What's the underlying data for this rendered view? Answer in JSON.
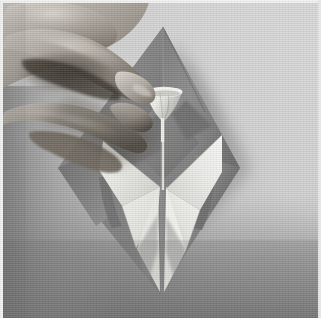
{
  "image": {
    "title": "Origami folding step photograph",
    "subject": "Two hands folding a square sheet of paper into an origami model",
    "medium": "grayscale photograph",
    "width": 321,
    "height": 318,
    "alt_text": "A pair of hands pinching the small white cone-shaped flap at the centre of a diamond-oriented sheet of grey origami paper; below it two white triangular points form a V shape.",
    "border": {
      "name": "thin white print border along the top and left edges",
      "color": "#f2f2f0",
      "thickness_px": 3
    },
    "palette": {
      "background_light": "#d2d2d2",
      "background_mid": "#c4c4c4",
      "background_shadow": "#a6a6a6",
      "table_dark": "#7d7d7d",
      "table_darkest": "#616161",
      "paper_light_face": "#ededea",
      "paper_white_highlight": "#f6f6f3",
      "paper_mid_face": "#9a9a9a",
      "paper_dark_face": "#6f6f6f",
      "paper_darkest_face": "#4e4e4e",
      "skin_light": "#c9c4bd",
      "skin_mid": "#9d968d",
      "skin_dark": "#6a6359",
      "skin_darkest": "#3a342d",
      "crease_line": "#5a5a5a"
    },
    "regions": [
      {
        "name": "background-surface",
        "description": "flat light grey table top filling the frame"
      },
      {
        "name": "cast-shadow",
        "description": "soft grey shadow cast down-right of the paper diamond"
      },
      {
        "name": "origami-paper-diamond",
        "description": "square sheet rotated 45 degrees, apex at top"
      },
      {
        "name": "left-hand-fingers",
        "description": "curled fingers of the left hand entering from upper left"
      },
      {
        "name": "pinching-fingertips",
        "description": "index finger and thumb tips meeting at the small white cone"
      },
      {
        "name": "white-cone-flap",
        "description": "small funnel shaped white flap standing up at the centre"
      },
      {
        "name": "center-crease",
        "description": "vertical crease line running from the cone to the bottom point"
      },
      {
        "name": "left-white-petal",
        "description": "white triangular point opening to the left"
      },
      {
        "name": "right-white-petal",
        "description": "white triangular point opening to the right"
      },
      {
        "name": "bottom-point",
        "description": "long narrow point of the model reaching the bottom of the frame"
      },
      {
        "name": "lower-dark-band",
        "description": "darker gradient band across the bottom of the photograph"
      }
    ]
  }
}
